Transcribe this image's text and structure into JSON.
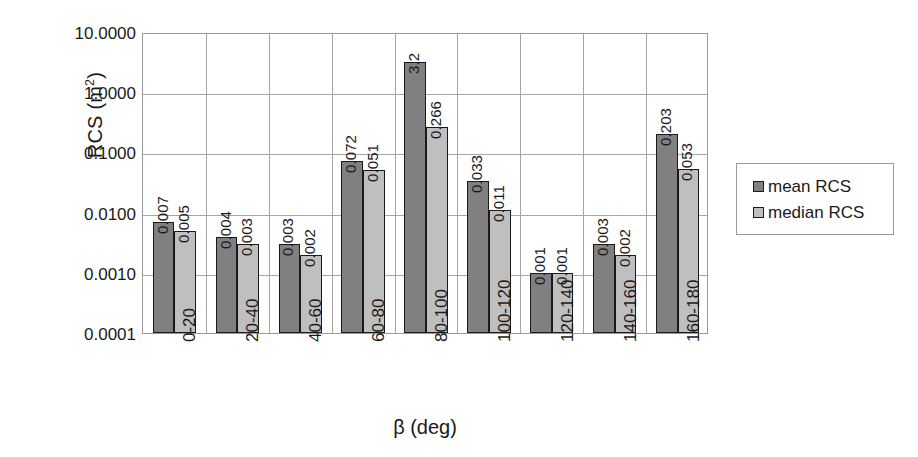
{
  "chart_data": {
    "type": "bar",
    "title": "",
    "xlabel": "β (deg)",
    "ylabel": "RCS (m²)",
    "ylabel_main": "RCS (m",
    "ylabel_exp": "2",
    "ylabel_tail": ")",
    "yscale": "log",
    "ylim": [
      0.0001,
      10
    ],
    "grid": true,
    "legend_position": "right",
    "categories": [
      "0-20",
      "20-40",
      "40-60",
      "60-80",
      "80-100",
      "100-120",
      "120-140",
      "140-160",
      "160-180"
    ],
    "y_ticks": [
      "10.0000",
      "1.0000",
      "0.1000",
      "0.0100",
      "0.0010",
      "0.0001"
    ],
    "y_tick_values": [
      10,
      1,
      0.1,
      0.01,
      0.001,
      0.0001
    ],
    "series": [
      {
        "name": "mean RCS",
        "color": "#808080",
        "values": [
          0.007,
          0.004,
          0.003,
          0.072,
          3.2,
          0.033,
          0.001,
          0.003,
          0.203
        ],
        "labels": [
          "0.007",
          "0.004",
          "0.003",
          "0.072",
          "3.2",
          "0.033",
          "0.001",
          "0.003",
          "0.203"
        ]
      },
      {
        "name": "median RCS",
        "color": "#bfbfbf",
        "values": [
          0.005,
          0.003,
          0.002,
          0.051,
          0.266,
          0.011,
          0.001,
          0.002,
          0.053
        ],
        "labels": [
          "0.005",
          "0.003",
          "0.002",
          "0.051",
          "0.266",
          "0.011",
          "0.001",
          "0.002",
          "0.053"
        ]
      }
    ]
  },
  "legend": {
    "items": [
      {
        "label": "mean RCS",
        "swatch": "mean"
      },
      {
        "label": "median RCS",
        "swatch": "median"
      }
    ]
  }
}
